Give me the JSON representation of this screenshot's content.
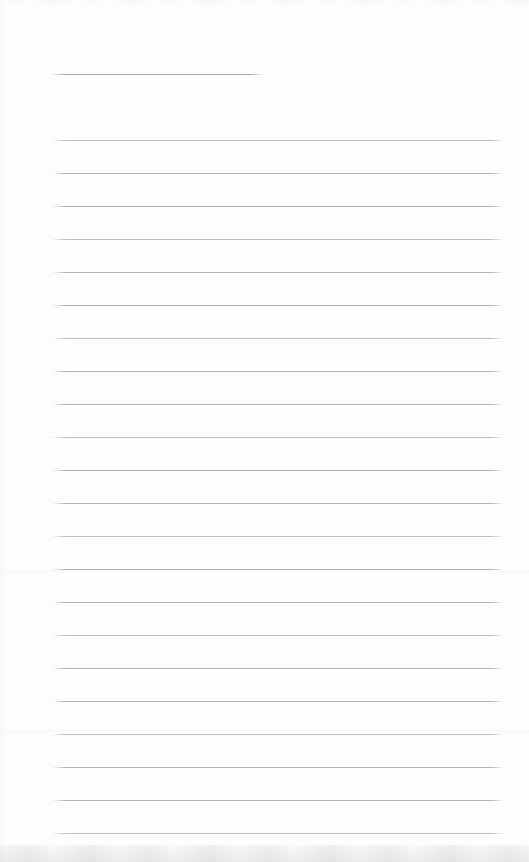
{
  "page": {
    "kind": "scanned-blank-ruled-page",
    "background_color": "#fdfdfd",
    "width_px": 529,
    "height_px": 862,
    "header_line": {
      "y": 74,
      "x_start": 51,
      "x_end": 263,
      "color": "#a9a9a9"
    },
    "ruled_lines": {
      "count": 22,
      "first_y": 140,
      "spacing": 33,
      "x_start": 52,
      "x_end": 504,
      "color": "#b3b3b3"
    },
    "creases": [
      {
        "y": 570
      },
      {
        "y": 730
      }
    ],
    "text_content": ""
  }
}
